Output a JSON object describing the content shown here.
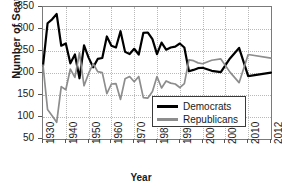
{
  "chart_data": {
    "type": "line",
    "title": "",
    "xlabel": "Year",
    "ylabel": "Number of Seats",
    "ylim": [
      50,
      350
    ],
    "yticks": [
      50,
      100,
      150,
      200,
      250,
      300,
      350
    ],
    "xticks": [
      1930,
      1940,
      1950,
      1960,
      1970,
      1980,
      1990,
      2000,
      2005,
      2010,
      2012
    ],
    "grid": true,
    "legend_position": "center-right",
    "x": [
      1930,
      1932,
      1934,
      1936,
      1938,
      1940,
      1942,
      1944,
      1946,
      1948,
      1950,
      1952,
      1954,
      1956,
      1958,
      1960,
      1962,
      1964,
      1966,
      1968,
      1970,
      1972,
      1974,
      1976,
      1978,
      1980,
      1982,
      1984,
      1986,
      1988,
      1990,
      1992,
      1994,
      1996,
      1998,
      2000,
      2002,
      2004,
      2006,
      2008,
      2010,
      2012
    ],
    "series": [
      {
        "name": "Democrats",
        "color": "#000000",
        "values": [
          216,
          313,
          322,
          334,
          262,
          267,
          222,
          242,
          188,
          263,
          235,
          213,
          232,
          234,
          283,
          262,
          258,
          295,
          248,
          243,
          255,
          242,
          291,
          292,
          277,
          243,
          269,
          253,
          258,
          260,
          267,
          258,
          204,
          207,
          211,
          212,
          205,
          202,
          233,
          257,
          193,
          201
        ]
      },
      {
        "name": "Republicans",
        "color": "#8d8d8d",
        "values": [
          218,
          117,
          103,
          88,
          169,
          162,
          209,
          190,
          246,
          171,
          199,
          221,
          203,
          201,
          153,
          175,
          176,
          140,
          187,
          192,
          180,
          192,
          144,
          143,
          158,
          192,
          166,
          182,
          177,
          175,
          167,
          176,
          230,
          228,
          223,
          221,
          229,
          232,
          202,
          178,
          242,
          234
        ]
      }
    ]
  },
  "legend": {
    "items": [
      {
        "label": "Democrats",
        "swatch": "dem"
      },
      {
        "label": "Republicans",
        "swatch": "rep"
      }
    ]
  },
  "axes": {
    "y_title": "Number of Seats",
    "x_title": "Year",
    "y_tick_labels": [
      "350",
      "300",
      "250",
      "200",
      "150",
      "100",
      "50"
    ],
    "x_tick_labels": [
      "1930",
      "1940",
      "1950",
      "1960",
      "1970",
      "1980",
      "1990",
      "2000",
      "2005",
      "2010",
      "2012"
    ]
  }
}
